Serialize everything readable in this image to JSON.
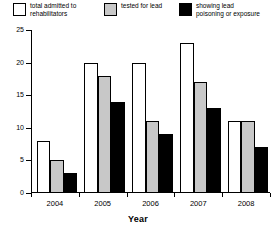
{
  "chart_data": {
    "type": "bar",
    "title": "",
    "xlabel": "Year",
    "ylabel": "",
    "categories": [
      "2004",
      "2005",
      "2006",
      "2007",
      "2008"
    ],
    "ylim": [
      0,
      25
    ],
    "yticks": [
      0,
      5,
      10,
      15,
      20,
      25
    ],
    "ytick_labels": [
      "0",
      "5",
      "10",
      "15",
      "20",
      "25"
    ],
    "grid": false,
    "legend_position": "top",
    "series": [
      {
        "name": "total admitted to\nrehabilitators",
        "color": "#ffffff",
        "values": [
          8,
          20,
          20,
          23,
          11
        ]
      },
      {
        "name": "tested for lead",
        "color": "#c8c8c8",
        "values": [
          5,
          18,
          11,
          17,
          11
        ]
      },
      {
        "name": "showing lead\npoisoning or exposure",
        "color": "#000000",
        "values": [
          3,
          14,
          9,
          13,
          7
        ]
      }
    ]
  }
}
